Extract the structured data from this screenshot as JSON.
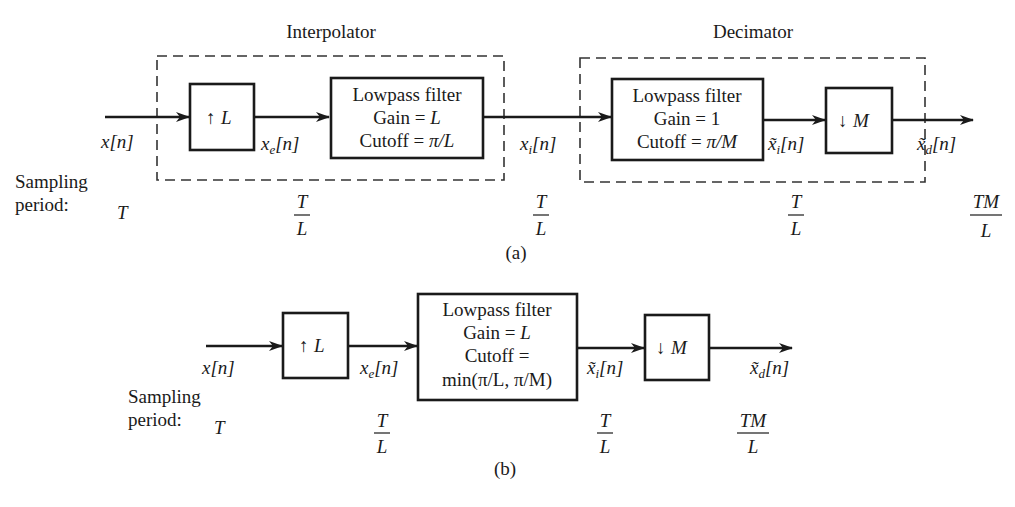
{
  "diagram_a": {
    "caption": "(a)",
    "interpolator_label": "Interpolator",
    "decimator_label": "Decimator",
    "upsampler": {
      "arrow": "↑",
      "factor": "L"
    },
    "lpf1": {
      "line1": "Lowpass filter",
      "line2": "Gain = ",
      "line2_var": "L",
      "line3": "Cutoff = ",
      "line3_var": "π/L"
    },
    "lpf2": {
      "line1": "Lowpass filter",
      "line2": "Gain = 1",
      "line3": "Cutoff = ",
      "line3_var": "π/M"
    },
    "downsampler": {
      "arrow": "↓",
      "factor": "M"
    },
    "signals": {
      "x": {
        "base": "x",
        "sub": "",
        "idx": "[n]"
      },
      "xe": {
        "base": "x",
        "sub": "e",
        "idx": "[n]"
      },
      "xi": {
        "base": "x",
        "sub": "i",
        "idx": "[n]"
      },
      "xi_tilde": {
        "base": "x̃",
        "sub": "i",
        "idx": "[n]"
      },
      "xd_tilde": {
        "base": "x̃",
        "sub": "d",
        "idx": "[n]"
      }
    },
    "sampling_label_1": "Sampling",
    "sampling_label_2": "period:",
    "periods": [
      {
        "num": "T",
        "den": ""
      },
      {
        "num": "T",
        "den": "L"
      },
      {
        "num": "T",
        "den": "L"
      },
      {
        "num": "T",
        "den": "L"
      },
      {
        "num": "TM",
        "den": "L"
      }
    ]
  },
  "diagram_b": {
    "caption": "(b)",
    "upsampler": {
      "arrow": "↑",
      "factor": "L"
    },
    "lpf": {
      "line1": "Lowpass filter",
      "line2": "Gain = ",
      "line2_var": "L",
      "line3": "Cutoff =",
      "line4": "min(π/L, π/M)"
    },
    "downsampler": {
      "arrow": "↓",
      "factor": "M"
    },
    "signals": {
      "x": {
        "base": "x",
        "sub": "",
        "idx": "[n]"
      },
      "xe": {
        "base": "x",
        "sub": "e",
        "idx": "[n]"
      },
      "xi_tilde": {
        "base": "x̃",
        "sub": "i",
        "idx": "[n]"
      },
      "xd_tilde": {
        "base": "x̃",
        "sub": "d",
        "idx": "[n]"
      }
    },
    "sampling_label_1": "Sampling",
    "sampling_label_2": "period:",
    "periods": [
      {
        "num": "T",
        "den": ""
      },
      {
        "num": "T",
        "den": "L"
      },
      {
        "num": "T",
        "den": "L"
      },
      {
        "num": "TM",
        "den": "L"
      }
    ]
  }
}
